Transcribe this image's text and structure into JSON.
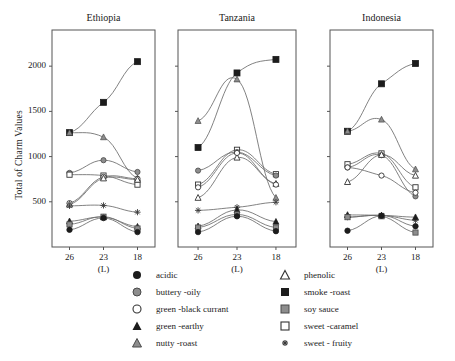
{
  "figure": {
    "ylabel": "Total of Charm Values",
    "xlabel": "(L)"
  },
  "chart_data": {
    "type": "line",
    "title": "",
    "xlabel": "(L)",
    "ylabel": "Total of Charm Values",
    "categories": [
      "26",
      "23",
      "18"
    ],
    "ylim": [
      0,
      2400
    ],
    "yticks": [
      500,
      1000,
      1500,
      2000
    ],
    "grid": false,
    "legend_position": "bottom",
    "panels": [
      {
        "title": "Ethiopia",
        "series": [
          {
            "name": "smoke-roast",
            "marker": "filled-square",
            "values": [
              1265,
              1600,
              2050
            ]
          },
          {
            "name": "nutty-roast",
            "marker": "gray-triangle",
            "values": [
              1265,
              1215,
              760
            ]
          },
          {
            "name": "buttery-oily",
            "marker": "gray-circle",
            "values": [
              820,
              960,
              830
            ]
          },
          {
            "name": "sweet-caramel",
            "marker": "open-square",
            "values": [
              800,
              790,
              690
            ]
          },
          {
            "name": "green-black currant",
            "marker": "open-circle",
            "values": [
              485,
              775,
              755
            ]
          },
          {
            "name": "phenolic",
            "marker": "open-triangle",
            "values": [
              470,
              760,
              745
            ]
          },
          {
            "name": "sweet-fruity",
            "marker": "asterisk",
            "values": [
              455,
              460,
              385
            ]
          },
          {
            "name": "green-earthy",
            "marker": "filled-triangle",
            "values": [
              285,
              330,
              225
            ]
          },
          {
            "name": "soy sauce",
            "marker": "gray-square",
            "values": [
              250,
              335,
              205
            ]
          },
          {
            "name": "acidic",
            "marker": "filled-circle",
            "values": [
              190,
              320,
              165
            ]
          }
        ]
      },
      {
        "title": "Tanzania",
        "series": [
          {
            "name": "smoke-roast",
            "marker": "filled-square",
            "values": [
              1100,
              1925,
              2075
            ]
          },
          {
            "name": "nutty-roast",
            "marker": "gray-triangle",
            "values": [
              1395,
              1855,
              545
            ]
          },
          {
            "name": "sweet-caramel",
            "marker": "open-square",
            "values": [
              690,
              1075,
              805
            ]
          },
          {
            "name": "buttery-oily",
            "marker": "gray-circle",
            "values": [
              845,
              1050,
              790
            ]
          },
          {
            "name": "phenolic",
            "marker": "open-triangle",
            "values": [
              545,
              990,
              700
            ]
          },
          {
            "name": "green-black currant",
            "marker": "open-circle",
            "values": [
              660,
              1040,
              690
            ]
          },
          {
            "name": "sweet-fruity",
            "marker": "asterisk",
            "values": [
              405,
              440,
              495
            ]
          },
          {
            "name": "green-earthy",
            "marker": "filled-triangle",
            "values": [
              230,
              410,
              280
            ]
          },
          {
            "name": "soy sauce",
            "marker": "gray-square",
            "values": [
              215,
              360,
              215
            ]
          },
          {
            "name": "acidic",
            "marker": "filled-circle",
            "values": [
              165,
              340,
              175
            ]
          }
        ]
      },
      {
        "title": "Indonesia",
        "series": [
          {
            "name": "smoke-roast",
            "marker": "filled-square",
            "values": [
              1280,
              1805,
              2030
            ]
          },
          {
            "name": "nutty-roast",
            "marker": "gray-triangle",
            "values": [
              1280,
              1410,
              860
            ]
          },
          {
            "name": "sweet-caramel",
            "marker": "open-square",
            "values": [
              915,
              1035,
              660
            ]
          },
          {
            "name": "buttery-oily",
            "marker": "gray-circle",
            "values": [
              880,
              1015,
              560
            ]
          },
          {
            "name": "phenolic",
            "marker": "open-triangle",
            "values": [
              720,
              1020,
              790
            ]
          },
          {
            "name": "green-black currant",
            "marker": "open-circle",
            "values": [
              880,
              790,
              600
            ]
          },
          {
            "name": "sweet-fruity",
            "marker": "asterisk",
            "values": [
              330,
              350,
              295
            ]
          },
          {
            "name": "green-earthy",
            "marker": "filled-triangle",
            "values": [
              355,
              350,
              330
            ]
          },
          {
            "name": "soy sauce",
            "marker": "gray-square",
            "values": [
              330,
              340,
              160
            ]
          },
          {
            "name": "acidic",
            "marker": "filled-circle",
            "values": [
              180,
              345,
              230
            ]
          }
        ]
      }
    ]
  },
  "legend": {
    "columns": [
      {
        "items": [
          {
            "label": "acidic",
            "marker": "filled-circle"
          },
          {
            "label": "buttery -oily",
            "marker": "gray-circle"
          },
          {
            "label": "green -black currant",
            "marker": "open-circle"
          },
          {
            "label": "green -earthy",
            "marker": "filled-triangle"
          },
          {
            "label": "nutty -roast",
            "marker": "gray-triangle"
          }
        ]
      },
      {
        "items": [
          {
            "label": "phenolic",
            "marker": "open-triangle"
          },
          {
            "label": "smoke -roast",
            "marker": "filled-square"
          },
          {
            "label": "soy sauce",
            "marker": "gray-square"
          },
          {
            "label": "sweet -caramel",
            "marker": "open-square"
          },
          {
            "label": "sweet - fruity",
            "marker": "asterisk"
          }
        ]
      }
    ]
  },
  "colors": {
    "line": "#6b6b6b",
    "axis": "#555555",
    "filled": "#1c1c1c",
    "gray": "#8d8d8d",
    "open": "#ffffff",
    "text": "#1a1a1a"
  }
}
